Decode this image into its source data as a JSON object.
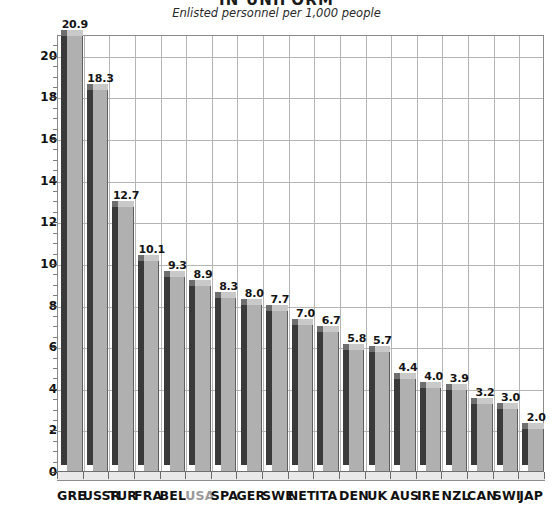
{
  "header": {
    "title": "IN UNIFORM",
    "subtitle": "Enlisted personnel per 1,000 people"
  },
  "axis": {
    "y_ticks": [
      "0",
      "2",
      "4",
      "6",
      "8",
      "10",
      "12",
      "14",
      "16",
      "18",
      "20"
    ]
  },
  "colors": {
    "bar_front": "#b0b0b0",
    "bar_side": "#3a3a3a",
    "bar_top": "#c9c9c9",
    "grid": "#b4b4b4",
    "text": "#111111",
    "muted_label": "#9a9a9a",
    "background": "#ffffff"
  },
  "chart_data": {
    "type": "bar",
    "title": "IN UNIFORM",
    "subtitle": "Enlisted personnel per 1,000 people",
    "xlabel": "",
    "ylabel": "",
    "ylim": [
      0,
      21
    ],
    "y_major_step": 2,
    "y_minor_step": 0.5,
    "grid": true,
    "legend": false,
    "style": "3d-column",
    "highlighted_category": "USA",
    "categories": [
      "GRE",
      "USSR",
      "TUR",
      "FRA",
      "BEL",
      "USA",
      "SPA",
      "GER",
      "SWE",
      "NET",
      "ITA",
      "DEN",
      "UK",
      "AUS",
      "IRE",
      "NZL",
      "CAN",
      "SWI",
      "JAP"
    ],
    "values": [
      20.9,
      18.3,
      12.7,
      10.1,
      9.3,
      8.9,
      8.3,
      8.0,
      7.7,
      7.0,
      6.7,
      5.8,
      5.7,
      4.4,
      4.0,
      3.9,
      3.2,
      3.0,
      2.0
    ],
    "value_labels": [
      "20.9",
      "18.3",
      "12.7",
      "10.1",
      "9.3",
      "8.9",
      "8.3",
      "8.0",
      "7.7",
      "7.0",
      "6.7",
      "5.8",
      "5.7",
      "4.4",
      "4.0",
      "3.9",
      "3.2",
      "3.0",
      "2.0"
    ]
  }
}
